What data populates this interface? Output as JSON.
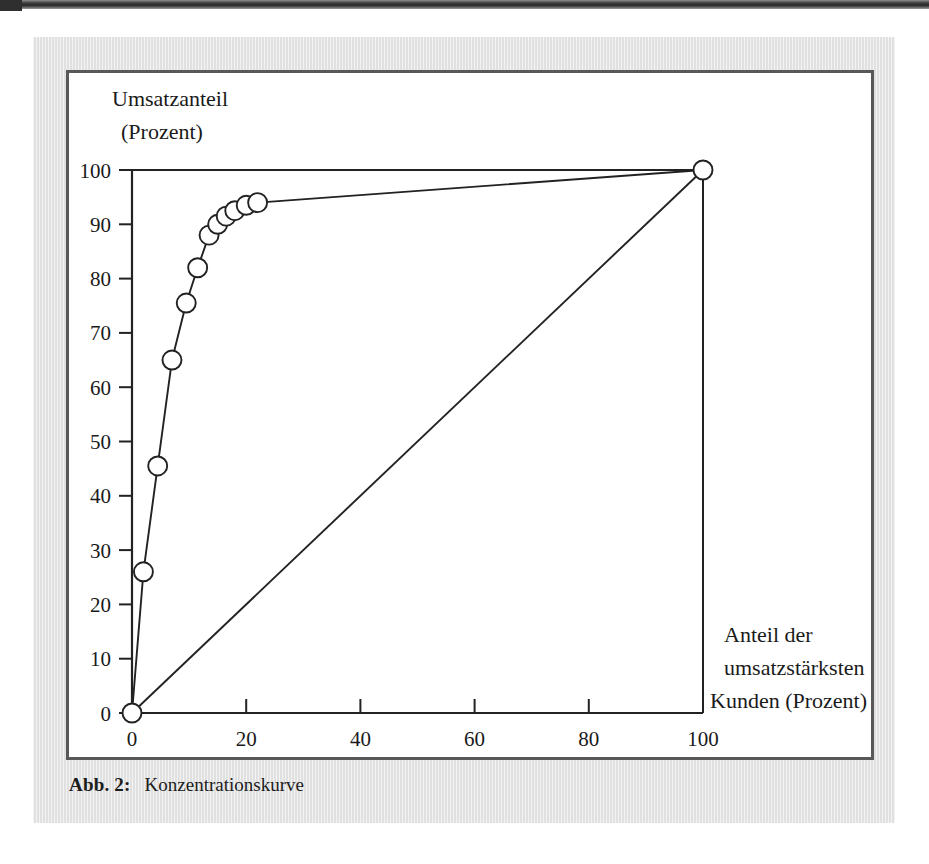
{
  "caption": {
    "label": "Abb. 2:",
    "text": "Konzentrationskurve"
  },
  "chart_data": {
    "type": "line",
    "title": "",
    "ylabel_line1": "Umsatzanteil",
    "ylabel_line2": "(Prozent)",
    "xlabel_line1": "Anteil der",
    "xlabel_line2": "umsatzstärksten",
    "xlabel_line3": "Kunden (Prozent)",
    "xlim": [
      0,
      100
    ],
    "ylim": [
      0,
      100
    ],
    "xticks": [
      0,
      20,
      40,
      60,
      80,
      100
    ],
    "yticks": [
      0,
      10,
      20,
      30,
      40,
      50,
      60,
      70,
      80,
      90,
      100
    ],
    "grid": false,
    "legend": "none",
    "series": [
      {
        "name": "Konzentrationskurve",
        "marker": "open-circle",
        "color": "#222222",
        "x": [
          0,
          2,
          4.5,
          7,
          9.5,
          11.5,
          13.5,
          15,
          16.5,
          18,
          20,
          22,
          100
        ],
        "y": [
          0,
          26,
          45.5,
          65,
          75.5,
          82,
          88,
          90,
          91.5,
          92.5,
          93.5,
          94,
          100
        ]
      },
      {
        "name": "Gleichverteilungsgerade",
        "marker": "none",
        "color": "#222222",
        "x": [
          0,
          100
        ],
        "y": [
          0,
          100
        ]
      }
    ]
  }
}
